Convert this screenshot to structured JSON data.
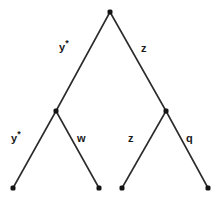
{
  "diagram": {
    "type": "binary-tree",
    "background_color": "#ffffff",
    "line_color": "#2b2b2b",
    "node_color": "#141414",
    "label_color": "#1a1a1a",
    "nodes": [
      {
        "id": "root",
        "x": 110,
        "y": 12,
        "kind": "internal"
      },
      {
        "id": "left-internal",
        "x": 56,
        "y": 111,
        "kind": "internal"
      },
      {
        "id": "right-internal",
        "x": 166,
        "y": 111,
        "kind": "internal"
      },
      {
        "id": "leaf-1",
        "x": 13,
        "y": 188,
        "kind": "leaf"
      },
      {
        "id": "leaf-2",
        "x": 99,
        "y": 188,
        "kind": "leaf"
      },
      {
        "id": "leaf-3",
        "x": 122,
        "y": 188,
        "kind": "leaf"
      },
      {
        "id": "leaf-4",
        "x": 208,
        "y": 188,
        "kind": "leaf"
      }
    ],
    "edges": [
      {
        "id": "root-left",
        "from": "root",
        "to": "left-internal",
        "x1": 110,
        "y1": 12,
        "x2": 56,
        "y2": 111
      },
      {
        "id": "root-right",
        "from": "root",
        "to": "right-internal",
        "x1": 110,
        "y1": 12,
        "x2": 166,
        "y2": 111
      },
      {
        "id": "left-left",
        "from": "left-internal",
        "to": "leaf-1",
        "x1": 56,
        "y1": 111,
        "x2": 13,
        "y2": 188
      },
      {
        "id": "left-right",
        "from": "left-internal",
        "to": "leaf-2",
        "x1": 56,
        "y1": 111,
        "x2": 99,
        "y2": 188
      },
      {
        "id": "right-left",
        "from": "right-internal",
        "to": "leaf-3",
        "x1": 166,
        "y1": 111,
        "x2": 122,
        "y2": 188
      },
      {
        "id": "right-right",
        "from": "right-internal",
        "to": "leaf-4",
        "x1": 166,
        "y1": 111,
        "x2": 208,
        "y2": 188
      }
    ],
    "edge_labels": {
      "root_left": {
        "base": "y",
        "sup": "*"
      },
      "root_right": {
        "base": "z",
        "sup": ""
      },
      "left_left": {
        "base": "y",
        "sup": "*"
      },
      "left_right": {
        "base": "w",
        "sup": ""
      },
      "right_left": {
        "base": "z",
        "sup": ""
      },
      "right_right": {
        "base": "q",
        "sup": ""
      }
    }
  }
}
